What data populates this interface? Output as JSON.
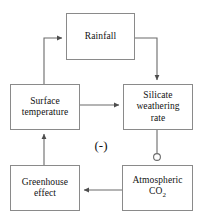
{
  "diagram": {
    "canvas": {
      "width": 203,
      "height": 219,
      "background": "#ffffff"
    },
    "style": {
      "box_border_color": "#8a8a8a",
      "line_color": "#5a5a5a",
      "text_color": "#111111"
    },
    "nodes": [
      {
        "id": "rainfall",
        "label": "Rainfall"
      },
      {
        "id": "surface",
        "label": "Surface\ntemperature"
      },
      {
        "id": "silicate",
        "label": "Silicate\nweathering\nrate"
      },
      {
        "id": "greenhouse",
        "label": "Greenhouse\neffect"
      },
      {
        "id": "co2",
        "label_main": "Atmospheric",
        "label_formula": "CO",
        "label_subscript": "2"
      }
    ],
    "annotations": [
      {
        "id": "negative-sign",
        "text": "(-)"
      }
    ],
    "edges": [
      {
        "from": "surface",
        "to": "rainfall",
        "marker": "arrow"
      },
      {
        "from": "rainfall",
        "to": "silicate",
        "marker": "arrow"
      },
      {
        "from": "surface",
        "to": "silicate",
        "marker": "arrow"
      },
      {
        "from": "silicate",
        "to": "co2",
        "marker": "circle"
      },
      {
        "from": "co2",
        "to": "greenhouse",
        "marker": "arrow"
      },
      {
        "from": "greenhouse",
        "to": "surface",
        "marker": "arrow"
      }
    ]
  }
}
